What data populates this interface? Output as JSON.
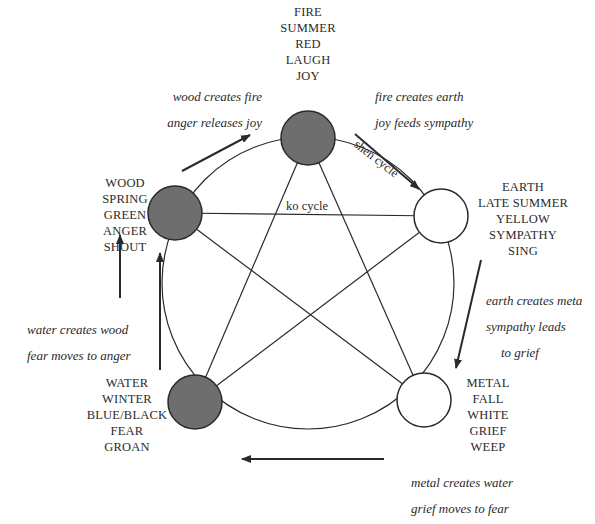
{
  "diagram": {
    "colors": {
      "filled_node": "#6e6e6e",
      "empty_node": "#ffffff",
      "stroke": "#2a2a2a"
    },
    "elements": [
      {
        "id": "fire",
        "filled": true,
        "lines": [
          "FIRE",
          "SUMMER",
          "RED",
          "LAUGH",
          "JOY"
        ]
      },
      {
        "id": "earth",
        "filled": false,
        "lines": [
          "EARTH",
          "LATE SUMMER",
          "YELLOW",
          "SYMPATHY",
          "SING"
        ]
      },
      {
        "id": "metal",
        "filled": false,
        "lines": [
          "METAL",
          "FALL",
          "WHITE",
          "GRIEF",
          "WEEP"
        ]
      },
      {
        "id": "water",
        "filled": true,
        "lines": [
          "WATER",
          "WINTER",
          "BLUE/BLACK",
          "FEAR",
          "GROAN"
        ]
      },
      {
        "id": "wood",
        "filled": true,
        "lines": [
          "WOOD",
          "SPRING",
          "GREEN",
          "ANGER",
          "SHOUT"
        ]
      }
    ],
    "notes": {
      "wood_fire": [
        "wood creates fire",
        "anger releases joy"
      ],
      "fire_earth": [
        "fire creates earth",
        "joy feeds sympathy"
      ],
      "earth_metal": [
        "earth creates meta",
        "sympathy leads",
        "to grief"
      ],
      "metal_water": [
        "metal creates water",
        "grief moves to fear"
      ],
      "water_wood": [
        "water creates wood",
        "fear moves to anger"
      ]
    },
    "cycle_labels": {
      "shen": "shen cycle",
      "ko": "ko cycle"
    }
  }
}
